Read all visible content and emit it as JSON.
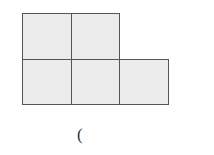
{
  "figure": {
    "fill_color": "#ececec",
    "stroke_color": "#555555",
    "cells": [
      {
        "row": 0,
        "col": 0
      },
      {
        "row": 0,
        "col": 1
      },
      {
        "row": 1,
        "col": 0
      },
      {
        "row": 1,
        "col": 1
      },
      {
        "row": 1,
        "col": 2
      }
    ]
  },
  "caption": {
    "text": "("
  }
}
